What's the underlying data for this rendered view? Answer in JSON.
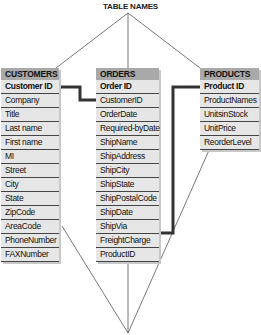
{
  "diagram": {
    "top_label": "TABLE NAMES",
    "tables": [
      {
        "name": "CUSTOMERS",
        "fields": [
          "Customer ID",
          "Company",
          "Title",
          "Last name",
          "First name",
          "MI",
          "Street",
          "City",
          "State",
          "ZipCode",
          "AreaCode",
          "PhoneNumber",
          "FAXNumber"
        ],
        "primary_key": "Customer ID"
      },
      {
        "name": "ORDERS",
        "fields": [
          "Order ID",
          "CustomerID",
          "OrderDate",
          "Required-byDate",
          "ShipName",
          "ShipAddress",
          "ShipCity",
          "ShipState",
          "ShipPostalCode",
          "ShipDate",
          "ShipVia",
          "FreightCharge",
          "ProductID"
        ],
        "primary_key": "Order ID"
      },
      {
        "name": "PRODUCTS",
        "fields": [
          "Product ID",
          "ProductNames",
          "UnitsinStock",
          "UnitPrice",
          "ReorderLevel"
        ],
        "primary_key": "Product ID"
      }
    ],
    "relationships": [
      {
        "from": "CUSTOMERS.Customer ID",
        "to": "ORDERS.CustomerID"
      },
      {
        "from": "PRODUCTS.Product ID",
        "to": "ORDERS.ProductID"
      }
    ],
    "colors": {
      "header_bg": "#a9a9a9",
      "body_bg": "#e6e6e6",
      "connector": "#333333"
    }
  }
}
